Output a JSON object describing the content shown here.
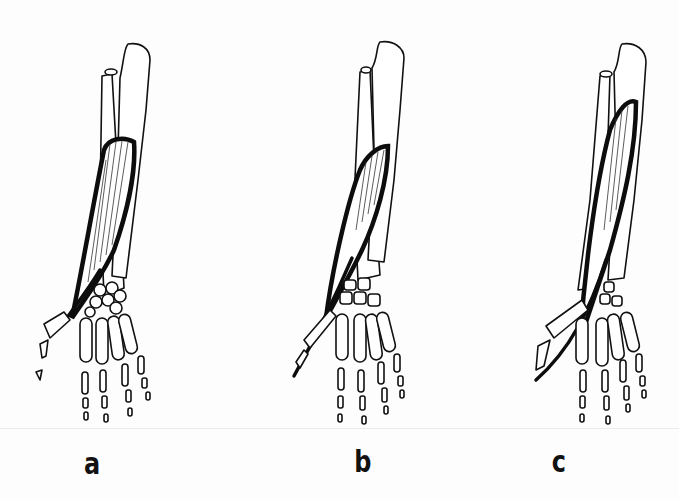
{
  "figure": {
    "panels": [
      {
        "id": "a",
        "label": "a"
      },
      {
        "id": "b",
        "label": "b"
      },
      {
        "id": "c",
        "label": "c"
      }
    ],
    "colors": {
      "background": "#fdfdfd",
      "ink": "#111111"
    }
  }
}
